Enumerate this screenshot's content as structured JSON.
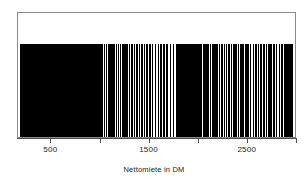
{
  "figure": {
    "background": "#ffffff",
    "frame_color": "#8a8a8a",
    "rug_color": "#000000",
    "axis_color": "#4d4d4d"
  },
  "chart_data": {
    "type": "rug",
    "title": "",
    "subtitle": "",
    "xlabel": "Nettomiete in DM",
    "ylabel": "",
    "grid": false,
    "legend": null,
    "xlim": [
      160,
      3000
    ],
    "ticks": [
      {
        "value": 500,
        "label": "500",
        "labeled": true
      },
      {
        "value": 1000,
        "label": "",
        "labeled": false
      },
      {
        "value": 1500,
        "label": "1500",
        "labeled": true
      },
      {
        "value": 2000,
        "label": "",
        "labeled": false
      },
      {
        "value": 2500,
        "label": "2500",
        "labeled": true
      },
      {
        "value": 3000,
        "label": "",
        "labeled": false
      }
    ],
    "tick_labels": [
      "500",
      "1500",
      "2500"
    ],
    "n_points": 180,
    "values": [
      185,
      196,
      205,
      212,
      218,
      224,
      231,
      236,
      240,
      245,
      249,
      253,
      258,
      262,
      266,
      270,
      274,
      278,
      283,
      287,
      292,
      296,
      301,
      306,
      311,
      316,
      321,
      326,
      332,
      337,
      343,
      348,
      354,
      360,
      366,
      372,
      378,
      384,
      390,
      397,
      403,
      410,
      417,
      424,
      431,
      438,
      446,
      453,
      461,
      469,
      477,
      485,
      493,
      502,
      510,
      519,
      528,
      537,
      546,
      556,
      565,
      575,
      585,
      595,
      605,
      616,
      627,
      638,
      649,
      660,
      672,
      684,
      696,
      708,
      721,
      734,
      747,
      760,
      774,
      788,
      802,
      816,
      831,
      846,
      861,
      877,
      893,
      909,
      926,
      943,
      960,
      978,
      996,
      1014,
      1033,
      1052,
      1071,
      1091,
      1111,
      1132,
      1153,
      1174,
      1196,
      1218,
      1241,
      1264,
      1288,
      1312,
      1336,
      1361,
      1387,
      1413,
      1439,
      1466,
      1494,
      1522,
      1551,
      1580,
      1610,
      1640,
      1671,
      1703,
      1735,
      1768,
      1780,
      1795,
      1812,
      1828,
      1840,
      1856,
      1870,
      1885,
      1898,
      1912,
      1928,
      1944,
      1960,
      1975,
      1990,
      2005,
      2020,
      2040,
      2058,
      2075,
      2092,
      2110,
      2135,
      2158,
      2180,
      2205,
      2230,
      2252,
      2275,
      2300,
      2325,
      2348,
      2370,
      2395,
      2420,
      2445,
      2470,
      2495,
      2520,
      2548,
      2575,
      2600,
      2628,
      2655,
      2680,
      2705,
      2730,
      2758,
      2785,
      2812,
      2840,
      2868,
      2890,
      2905,
      2920,
      2940
    ]
  }
}
